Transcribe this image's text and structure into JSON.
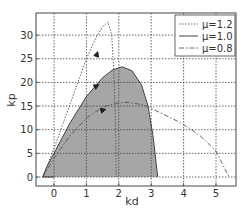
{
  "chart_data": {
    "type": "line",
    "title": "",
    "xlabel": "kd",
    "ylabel": "kp",
    "xlim": [
      -0.55,
      5.65
    ],
    "ylim": [
      -1.9,
      34.6
    ],
    "grid": true,
    "legend_position": "upper right",
    "x_ticks": [
      0,
      1,
      2,
      3,
      4,
      5
    ],
    "y_ticks": [
      0,
      5,
      10,
      15,
      20,
      25,
      30
    ],
    "series": [
      {
        "name": "μ=1.2",
        "style": "dotted",
        "x": [
          -0.35,
          0,
          0.5,
          1.0,
          1.3,
          1.5,
          1.67,
          1.78,
          1.85,
          1.9,
          1.92
        ],
        "y": [
          0,
          6,
          15.5,
          25,
          29.5,
          31.8,
          32.8,
          30,
          22,
          10,
          0
        ]
      },
      {
        "name": "μ=1.0",
        "style": "solid",
        "filled": true,
        "x": [
          -0.35,
          -0.2,
          0,
          0.5,
          1.0,
          1.5,
          1.8,
          2.1,
          2.4,
          2.7,
          2.9,
          3.05,
          3.15,
          3.2
        ],
        "y": [
          0,
          2.5,
          5,
          11.5,
          17,
          21,
          22.6,
          23.3,
          22.5,
          19.5,
          15,
          9,
          3,
          0
        ]
      },
      {
        "name": "μ=0.8",
        "style": "dashdot",
        "x": [
          -0.35,
          0,
          0.5,
          1.0,
          1.5,
          2.0,
          2.3,
          2.8,
          3.3,
          3.9,
          4.5,
          5.0,
          5.4
        ],
        "y": [
          0,
          4,
          8.8,
          12.4,
          14.8,
          15.7,
          15.8,
          15.2,
          13.5,
          11.5,
          8.8,
          5.5,
          0
        ]
      }
    ],
    "annotations": [
      {
        "type": "arrow",
        "series": "μ=1.2",
        "at": [
          1.3,
          25.5
        ]
      },
      {
        "type": "arrow",
        "series": "μ=1.0",
        "at": [
          1.25,
          19
        ]
      },
      {
        "type": "arrow",
        "series": "μ=0.8",
        "at": [
          1.45,
          14
        ]
      }
    ]
  },
  "axes": {
    "xlabel": "kd",
    "ylabel": "kp",
    "x_ticks": [
      "0",
      "1",
      "2",
      "3",
      "4",
      "5"
    ],
    "y_ticks": [
      "0",
      "5",
      "10",
      "15",
      "20",
      "25",
      "30"
    ]
  },
  "legend": {
    "items": [
      {
        "label": "μ=1.2",
        "style": "dotted"
      },
      {
        "label": "μ=1.0",
        "style": "solid"
      },
      {
        "label": "μ=0.8",
        "style": "dashdot"
      }
    ]
  },
  "colors": {
    "fill": "#a6a6a6",
    "line": "#555555",
    "grid": "#444444",
    "axes": "#444444"
  }
}
